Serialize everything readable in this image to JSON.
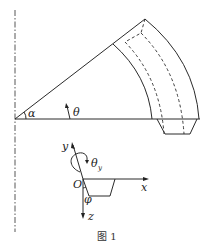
{
  "figure": {
    "caption": "图 1",
    "labels": {
      "alpha": "α",
      "theta": "θ",
      "theta_y": "θ",
      "theta_y_sub": "y",
      "y_axis": "y",
      "x_axis": "x",
      "z_axis": "z",
      "origin": "O",
      "phi": "φ"
    }
  }
}
